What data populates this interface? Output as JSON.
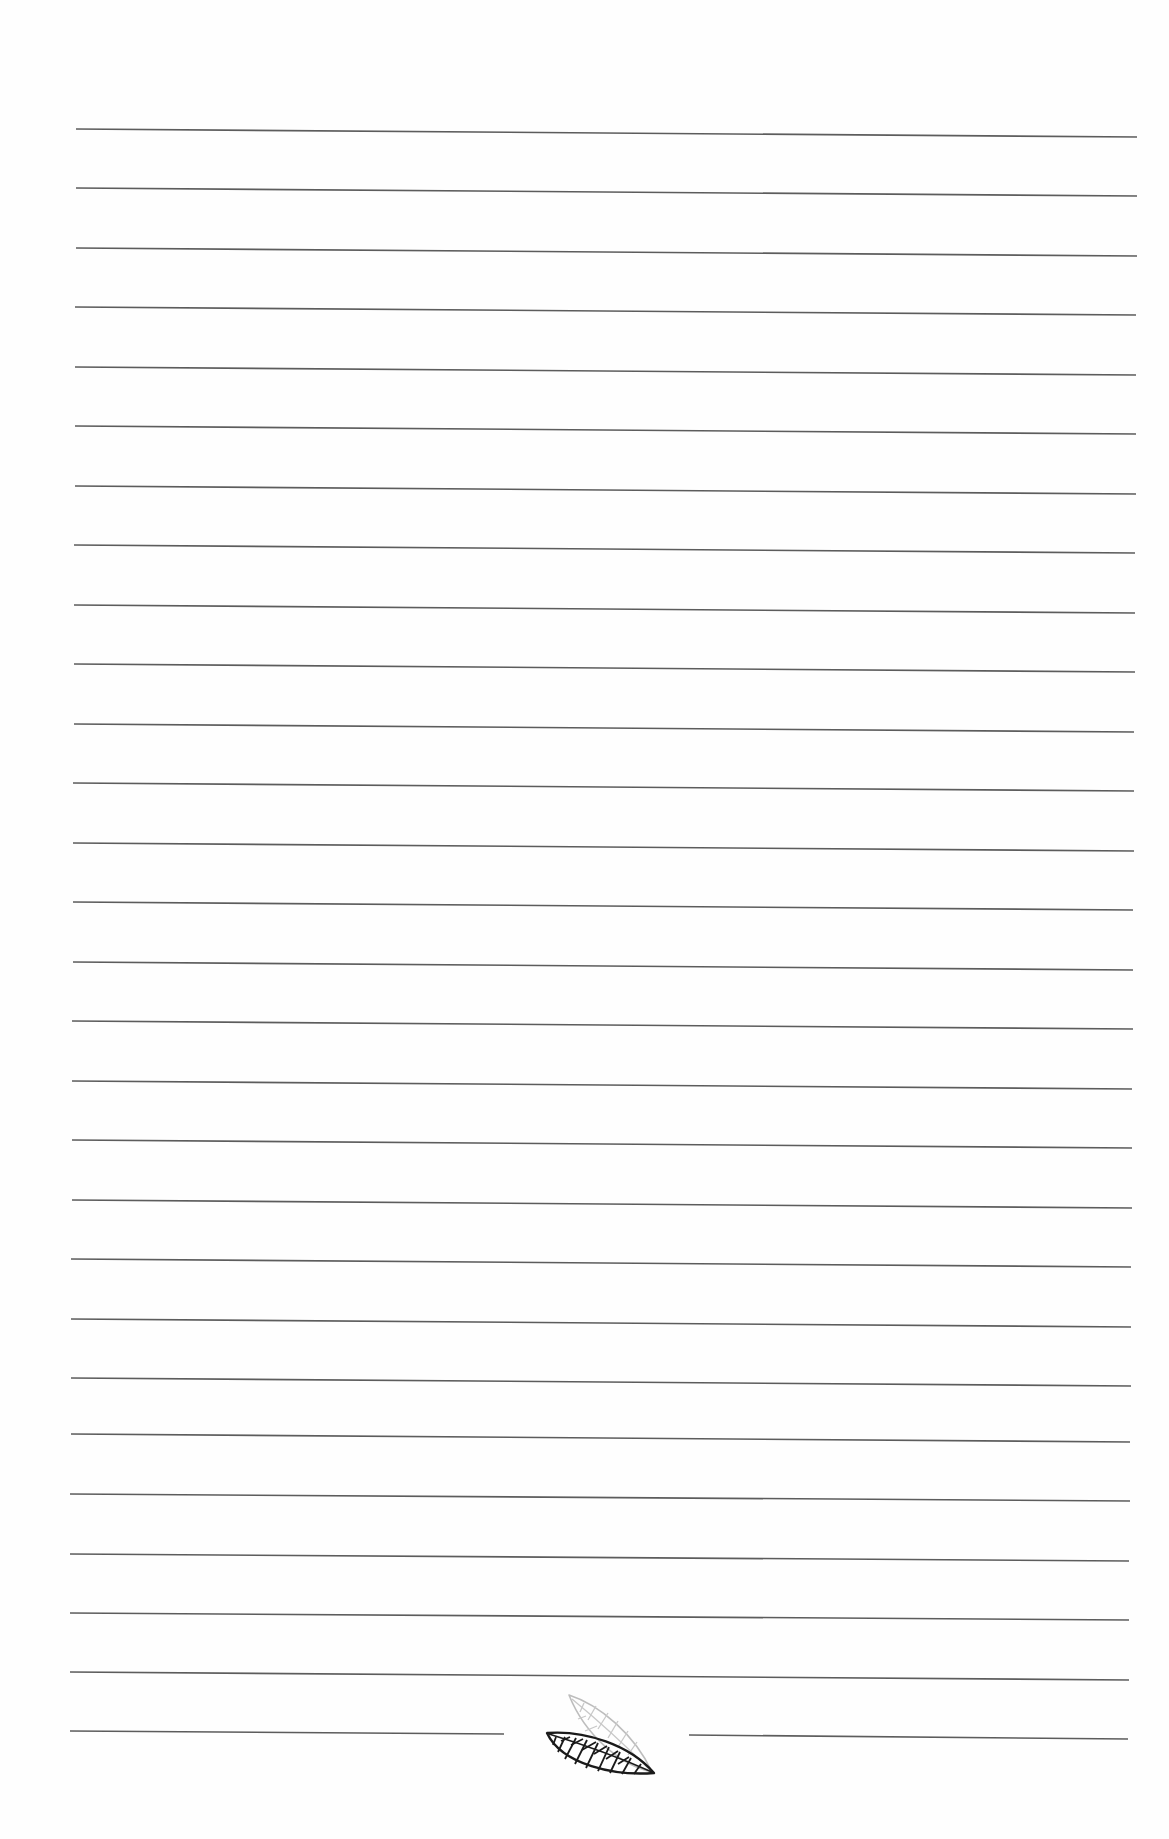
{
  "page": {
    "type": "lined-notebook-page",
    "background": "#fefefe",
    "rule_color": "#5c5c5c"
  },
  "ruled_lines": [
    {
      "x1": 76,
      "y1": 129,
      "x2": 1137,
      "y2": 137
    },
    {
      "x1": 76,
      "y1": 188,
      "x2": 1137,
      "y2": 196
    },
    {
      "x1": 76,
      "y1": 248,
      "x2": 1137,
      "y2": 256
    },
    {
      "x1": 75,
      "y1": 307,
      "x2": 1136,
      "y2": 315
    },
    {
      "x1": 75,
      "y1": 367,
      "x2": 1136,
      "y2": 375
    },
    {
      "x1": 75,
      "y1": 426,
      "x2": 1136,
      "y2": 434
    },
    {
      "x1": 75,
      "y1": 486,
      "x2": 1136,
      "y2": 494
    },
    {
      "x1": 74,
      "y1": 545,
      "x2": 1135,
      "y2": 553
    },
    {
      "x1": 74,
      "y1": 605,
      "x2": 1135,
      "y2": 613
    },
    {
      "x1": 74,
      "y1": 664,
      "x2": 1135,
      "y2": 672
    },
    {
      "x1": 74,
      "y1": 724,
      "x2": 1134,
      "y2": 732
    },
    {
      "x1": 73,
      "y1": 783,
      "x2": 1134,
      "y2": 791
    },
    {
      "x1": 73,
      "y1": 843,
      "x2": 1134,
      "y2": 851
    },
    {
      "x1": 73,
      "y1": 902,
      "x2": 1133,
      "y2": 910
    },
    {
      "x1": 73,
      "y1": 962,
      "x2": 1133,
      "y2": 970
    },
    {
      "x1": 72,
      "y1": 1021,
      "x2": 1133,
      "y2": 1029
    },
    {
      "x1": 72,
      "y1": 1081,
      "x2": 1132,
      "y2": 1089
    },
    {
      "x1": 72,
      "y1": 1140,
      "x2": 1132,
      "y2": 1148
    },
    {
      "x1": 72,
      "y1": 1200,
      "x2": 1132,
      "y2": 1208
    },
    {
      "x1": 71,
      "y1": 1259,
      "x2": 1131,
      "y2": 1267
    },
    {
      "x1": 71,
      "y1": 1319,
      "x2": 1131,
      "y2": 1327
    },
    {
      "x1": 71,
      "y1": 1378,
      "x2": 1131,
      "y2": 1386
    },
    {
      "x1": 71,
      "y1": 1434,
      "x2": 1130,
      "y2": 1442
    },
    {
      "x1": 70,
      "y1": 1494,
      "x2": 1130,
      "y2": 1501
    },
    {
      "x1": 70,
      "y1": 1554,
      "x2": 1129,
      "y2": 1561
    },
    {
      "x1": 70,
      "y1": 1613,
      "x2": 1129,
      "y2": 1620
    },
    {
      "x1": 70,
      "y1": 1672,
      "x2": 1129,
      "y2": 1680
    }
  ],
  "footer_line": {
    "left_segment": {
      "x1": 70,
      "y1": 1731,
      "x2": 504,
      "y2": 1734
    },
    "right_segment": {
      "x1": 689,
      "y1": 1735,
      "x2": 1128,
      "y2": 1739
    }
  },
  "ornament": {
    "name": "leaf-ornament",
    "description": "two overlapping leaves, one dark outlined with veins, one light gray behind",
    "dark_color": "#1a1a1a",
    "light_color": "#bdbdbd"
  }
}
